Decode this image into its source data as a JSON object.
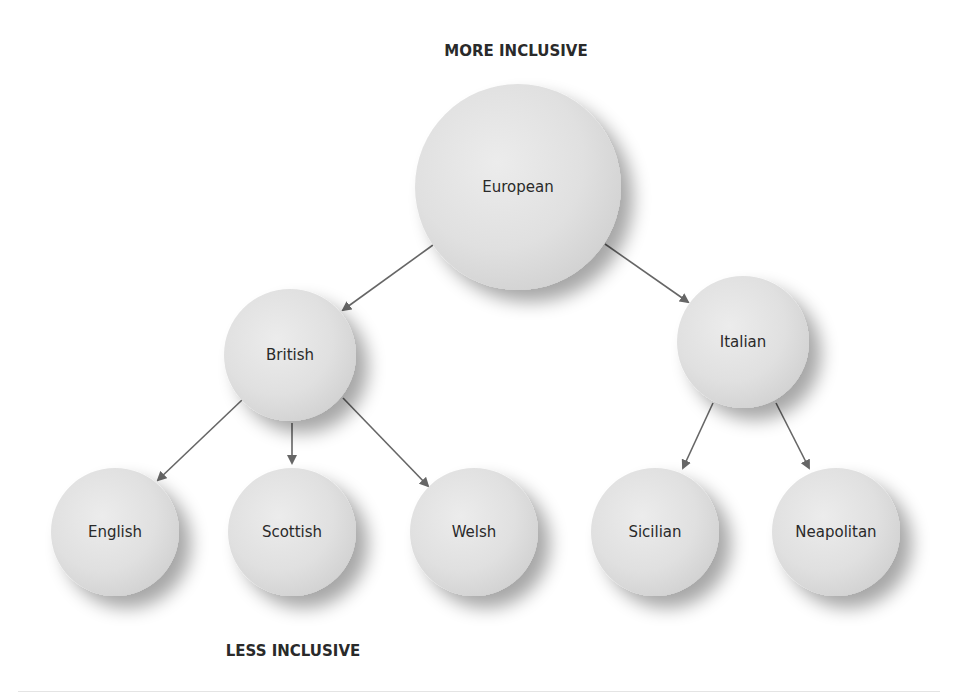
{
  "labels": {
    "top": "MORE INCLUSIVE",
    "bottom": "LESS INCLUSIVE"
  },
  "colors": {
    "node_fill_light": "#ececec",
    "node_fill_dark": "#d2d2d2",
    "edge": "#666666",
    "text": "#2a2a2a"
  },
  "nodes": [
    {
      "id": "european",
      "label": "European",
      "level": 0,
      "cx": 518,
      "cy": 187,
      "r": 103
    },
    {
      "id": "british",
      "label": "British",
      "level": 1,
      "cx": 290,
      "cy": 355,
      "r": 66
    },
    {
      "id": "italian",
      "label": "Italian",
      "level": 1,
      "cx": 743,
      "cy": 342,
      "r": 66
    },
    {
      "id": "english",
      "label": "English",
      "level": 2,
      "cx": 115,
      "cy": 532,
      "r": 64
    },
    {
      "id": "scottish",
      "label": "Scottish",
      "level": 2,
      "cx": 292,
      "cy": 532,
      "r": 64
    },
    {
      "id": "welsh",
      "label": "Welsh",
      "level": 2,
      "cx": 474,
      "cy": 532,
      "r": 64
    },
    {
      "id": "sicilian",
      "label": "Sicilian",
      "level": 2,
      "cx": 655,
      "cy": 532,
      "r": 64
    },
    {
      "id": "neapolitan",
      "label": "Neapolitan",
      "level": 2,
      "cx": 836,
      "cy": 532,
      "r": 64
    }
  ],
  "edges": [
    {
      "from": "european",
      "to": "british",
      "x1": 433,
      "y1": 245,
      "x2": 343,
      "y2": 310
    },
    {
      "from": "european",
      "to": "italian",
      "x1": 605,
      "y1": 244,
      "x2": 688,
      "y2": 302
    },
    {
      "from": "british",
      "to": "english",
      "x1": 242,
      "y1": 400,
      "x2": 158,
      "y2": 480
    },
    {
      "from": "british",
      "to": "scottish",
      "x1": 292,
      "y1": 423,
      "x2": 292,
      "y2": 463
    },
    {
      "from": "british",
      "to": "welsh",
      "x1": 343,
      "y1": 398,
      "x2": 428,
      "y2": 486
    },
    {
      "from": "italian",
      "to": "sicilian",
      "x1": 713,
      "y1": 403,
      "x2": 683,
      "y2": 468
    },
    {
      "from": "italian",
      "to": "neapolitan",
      "x1": 776,
      "y1": 403,
      "x2": 809,
      "y2": 468
    }
  ]
}
